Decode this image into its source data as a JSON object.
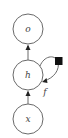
{
  "diagram": {
    "type": "recurrent-network-graph",
    "nodes": [
      {
        "id": "o",
        "label": "o",
        "cx": 28,
        "cy": 29,
        "r": 15
      },
      {
        "id": "h",
        "label": "h",
        "cx": 28,
        "cy": 75,
        "r": 15
      },
      {
        "id": "x",
        "label": "x",
        "cx": 28,
        "cy": 119,
        "r": 15
      }
    ],
    "edges": [
      {
        "from": "h",
        "to": "o"
      },
      {
        "from": "x",
        "to": "h"
      },
      {
        "from": "h",
        "to": "h",
        "kind": "self-loop",
        "via": "delay-square",
        "label": "f"
      }
    ],
    "self_loop_label": "f",
    "colors": {
      "stroke": "#6a6a6a",
      "delay_square": "#111111",
      "arrowhead": "#222222"
    }
  }
}
